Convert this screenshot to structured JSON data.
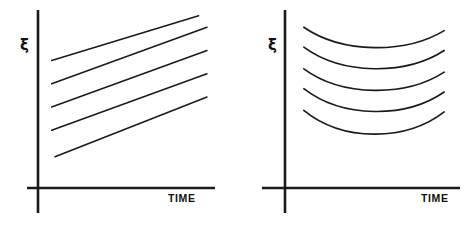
{
  "figure": {
    "width": 472,
    "height": 225,
    "background": "#ffffff",
    "ink_color": "#1a1a1a",
    "panel_count": 2
  },
  "panels": [
    {
      "id": "left",
      "name": "linear-growth-panel",
      "ylabel": "ξ",
      "xlabel": "TIME",
      "curve_family": "parallel-straight-lines",
      "curve_count": 5
    },
    {
      "id": "right",
      "name": "parabolic-panel",
      "ylabel": "ξ",
      "xlabel": "TIME",
      "curve_family": "nested-u-shaped-curves",
      "curve_count": 5
    }
  ],
  "chart_data": [
    {
      "type": "line",
      "title": "",
      "xlabel": "TIME",
      "ylabel": "ξ",
      "grid": false,
      "legend": null,
      "axis_style": "bare-cross-axes-no-ticks",
      "xlim": [
        0,
        1
      ],
      "ylim": [
        0,
        1
      ],
      "description": "Five parallel straight lines of equal positive slope, evenly offset vertically.",
      "series": [
        {
          "name": "line-1",
          "x": [
            0.04,
            0.92
          ],
          "y": [
            0.72,
            0.99
          ]
        },
        {
          "name": "line-2",
          "x": [
            0.04,
            0.97
          ],
          "y": [
            0.58,
            0.92
          ]
        },
        {
          "name": "line-3",
          "x": [
            0.04,
            0.97
          ],
          "y": [
            0.44,
            0.78
          ]
        },
        {
          "name": "line-4",
          "x": [
            0.04,
            0.97
          ],
          "y": [
            0.3,
            0.64
          ]
        },
        {
          "name": "line-5",
          "x": [
            0.06,
            0.97
          ],
          "y": [
            0.14,
            0.5
          ]
        }
      ]
    },
    {
      "type": "line",
      "title": "",
      "xlabel": "TIME",
      "ylabel": "ξ",
      "grid": false,
      "legend": null,
      "axis_style": "bare-cross-axes-no-ticks",
      "xlim": [
        0,
        1
      ],
      "ylim": [
        0,
        1
      ],
      "description": "Five nested upward-opening (U-shaped) curves, each dipping to a minimum near mid-span then rising, stacked with even vertical offsets.",
      "series": [
        {
          "name": "curve-1",
          "x": [
            0.05,
            0.5,
            0.95
          ],
          "y": [
            0.92,
            0.76,
            0.9
          ]
        },
        {
          "name": "curve-2",
          "x": [
            0.05,
            0.5,
            0.95
          ],
          "y": [
            0.8,
            0.63,
            0.78
          ]
        },
        {
          "name": "curve-3",
          "x": [
            0.05,
            0.5,
            0.95
          ],
          "y": [
            0.67,
            0.5,
            0.65
          ]
        },
        {
          "name": "curve-4",
          "x": [
            0.05,
            0.5,
            0.95
          ],
          "y": [
            0.55,
            0.37,
            0.53
          ]
        },
        {
          "name": "curve-5",
          "x": [
            0.05,
            0.5,
            0.95
          ],
          "y": [
            0.42,
            0.23,
            0.41
          ]
        }
      ]
    }
  ]
}
